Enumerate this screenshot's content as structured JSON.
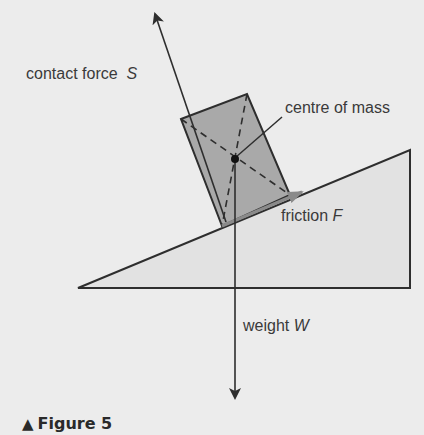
{
  "diagram": {
    "caption": {
      "marker": "▲",
      "text": "Figure 5"
    },
    "labels": {
      "contact_force": {
        "text": "contact force",
        "symbol": "S"
      },
      "centre_of_mass": {
        "text": "centre of mass"
      },
      "friction": {
        "text": "friction",
        "symbol": "F"
      },
      "weight": {
        "text": "weight",
        "symbol": "W"
      }
    },
    "colors": {
      "background": "#ececec",
      "wedge_fill": "#e2e2e2",
      "block_fill": "#a9a9a9",
      "line": "#2e2e2e",
      "friction_arrow": "#8a8a8a"
    },
    "shapes": {
      "wedge": "78,288 410,150 410,288",
      "block": "181,119 247,94 290,195 222,226"
    }
  }
}
